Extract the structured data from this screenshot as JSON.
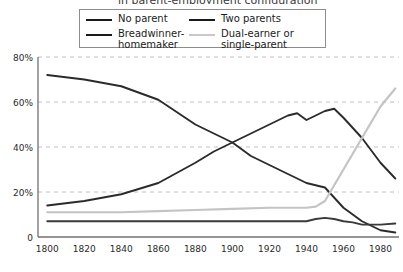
{
  "title_partial": "in parent-employment configuration",
  "legend": {
    "entries": [
      {
        "label": "No parent",
        "color": "#1a1a1a",
        "key": "no_parent"
      },
      {
        "label": "Two parents",
        "color": "#1a1a1a",
        "key": "two_parents"
      },
      {
        "label": "Breadwinner-\nhomemaker",
        "color": "#1a1a1a",
        "key": "breadwinner_homemaker"
      },
      {
        "label": "Dual-earner or\nsingle-parent",
        "color": "#c9c9c9",
        "key": "dual_earner_single_parent"
      }
    ]
  },
  "chart_data": {
    "type": "line",
    "title": "",
    "xlabel": "",
    "ylabel": "",
    "xlim": [
      1795,
      1990
    ],
    "ylim": [
      0,
      80
    ],
    "xticks": [
      1800,
      1820,
      1840,
      1860,
      1880,
      1900,
      1920,
      1940,
      1960,
      1980
    ],
    "xticklabels": [
      "1800",
      "1820",
      "1840",
      "1860",
      "1880",
      "1900",
      "1920",
      "1940",
      "1960",
      "1980"
    ],
    "yticks": [
      0,
      20,
      40,
      60,
      80
    ],
    "yticklabels": [
      "0",
      "20%",
      "40%",
      "60%",
      "80%"
    ],
    "grid": "horizontal-dashed",
    "legend_position": "top-center",
    "grid_color": "#c0c0c0",
    "axis_color": "#707070",
    "series": [
      {
        "name": "Breadwinner-homemaker",
        "color": "#2b2b2b",
        "width": 1.9,
        "x": [
          1800,
          1820,
          1840,
          1860,
          1880,
          1890,
          1900,
          1910,
          1920,
          1930,
          1940,
          1950,
          1960,
          1970,
          1980,
          1988
        ],
        "values": [
          72,
          70,
          67,
          61,
          50,
          46,
          42,
          36,
          32,
          28,
          24,
          22,
          13,
          7,
          3,
          2
        ]
      },
      {
        "name": "Two parents",
        "color": "#2b2b2b",
        "width": 1.9,
        "x": [
          1800,
          1820,
          1840,
          1860,
          1880,
          1890,
          1900,
          1910,
          1920,
          1930,
          1935,
          1940,
          1950,
          1955,
          1960,
          1970,
          1980,
          1988
        ],
        "values": [
          14,
          16,
          19,
          24,
          33,
          38,
          42,
          46,
          50,
          54,
          55,
          52,
          56,
          57,
          53,
          44,
          33,
          26
        ]
      },
      {
        "name": "Dual-earner or single-parent",
        "color": "#c4c4c4",
        "width": 2.2,
        "x": [
          1800,
          1820,
          1840,
          1860,
          1880,
          1900,
          1920,
          1940,
          1945,
          1950,
          1960,
          1970,
          1980,
          1988
        ],
        "values": [
          11,
          11,
          11,
          11.5,
          12,
          12.5,
          13,
          13,
          13.5,
          16,
          30,
          44,
          58,
          66
        ]
      },
      {
        "name": "No parent",
        "color": "#3a3a3a",
        "width": 1.9,
        "x": [
          1800,
          1820,
          1840,
          1860,
          1880,
          1900,
          1920,
          1940,
          1945,
          1950,
          1955,
          1960,
          1965,
          1970,
          1980,
          1988
        ],
        "values": [
          7,
          7,
          7,
          7,
          7,
          7,
          7,
          7,
          8,
          8.5,
          8,
          7,
          6.5,
          5.5,
          5.5,
          6
        ]
      }
    ]
  }
}
